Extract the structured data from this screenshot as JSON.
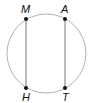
{
  "diagram": {
    "circle": {
      "cx": 46.5,
      "cy": 53.5,
      "r": 39.5,
      "stroke": "#b3b3b3"
    },
    "points": [
      {
        "label": "M",
        "x": 26,
        "y": 19
      },
      {
        "label": "A",
        "x": 65,
        "y": 19
      },
      {
        "label": "H",
        "x": 26,
        "y": 88
      },
      {
        "label": "T",
        "x": 65,
        "y": 88
      }
    ],
    "segments": [
      {
        "from": "M",
        "to": "H"
      },
      {
        "from": "A",
        "to": "T"
      }
    ],
    "line_color": "#777777",
    "point_color": "#111111"
  }
}
